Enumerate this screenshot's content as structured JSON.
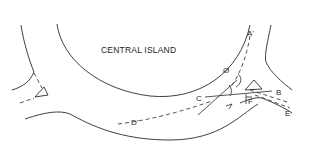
{
  "diagram": {
    "type": "roundabout-geometry",
    "island_label": "CENTRAL ISLAND",
    "angle_symbol": "Ø",
    "points": {
      "A": "A'",
      "B": "B",
      "C": "C",
      "D": "D'",
      "E": "E",
      "F": "F"
    },
    "line_color": "#2a2a2a",
    "background": "#ffffff"
  }
}
